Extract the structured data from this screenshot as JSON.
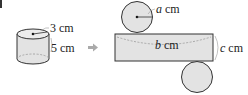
{
  "diagram": {
    "cylinder": {
      "radius_label": "3 cm",
      "height_label": "5 cm"
    },
    "arrow": "➡",
    "net": {
      "circle_radius_var": "a",
      "rect_length_var": "b",
      "rect_height_var": "c",
      "unit": "cm"
    },
    "colors": {
      "fill": "#e3e3e3",
      "stroke": "#333333",
      "dashed": "#9a9a9a",
      "arrow": "#aaaaaa",
      "text": "#222222"
    }
  }
}
